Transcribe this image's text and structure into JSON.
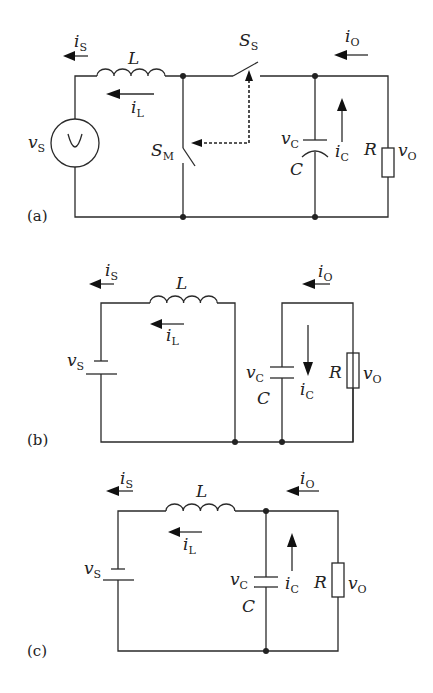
{
  "figure": {
    "panels": [
      {
        "tag": "(a)",
        "labels": {
          "i_s": "i",
          "i_s_sub": "S",
          "L": "L",
          "i_l": "i",
          "i_l_sub": "L",
          "v_s": "v",
          "v_s_sub": "S",
          "s_m": "S",
          "s_m_sub": "M",
          "s_s": "S",
          "s_s_sub": "S",
          "i_o": "i",
          "i_o_sub": "O",
          "v_c": "v",
          "v_c_sub": "C",
          "C": "C",
          "i_c": "i",
          "i_c_sub": "C",
          "R": "R",
          "v_o": "v",
          "v_o_sub": "O"
        }
      },
      {
        "tag": "(b)",
        "labels": {
          "i_s": "i",
          "i_s_sub": "S",
          "L": "L",
          "i_l": "i",
          "i_l_sub": "L",
          "v_s": "v",
          "v_s_sub": "S",
          "i_o": "i",
          "i_o_sub": "O",
          "v_c": "v",
          "v_c_sub": "C",
          "C": "C",
          "i_c": "i",
          "i_c_sub": "C",
          "R": "R",
          "v_o": "v",
          "v_o_sub": "O"
        }
      },
      {
        "tag": "(c)",
        "labels": {
          "i_s": "i",
          "i_s_sub": "S",
          "L": "L",
          "i_l": "i",
          "i_l_sub": "L",
          "v_s": "v",
          "v_s_sub": "S",
          "i_o": "i",
          "i_o_sub": "O",
          "v_c": "v",
          "v_c_sub": "C",
          "C": "C",
          "i_c": "i",
          "i_c_sub": "C",
          "R": "R",
          "v_o": "v",
          "v_o_sub": "O"
        }
      }
    ]
  }
}
